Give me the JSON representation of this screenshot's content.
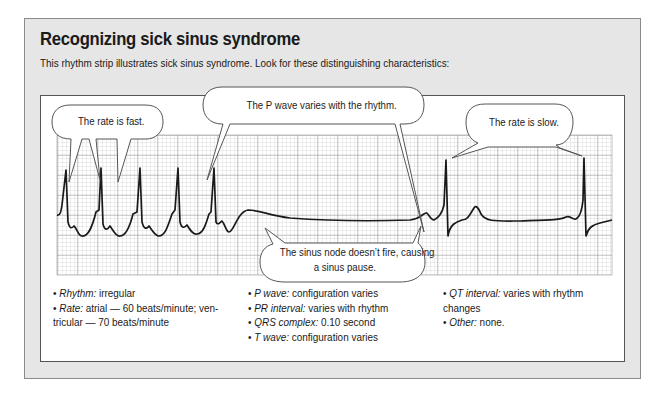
{
  "figure": {
    "title": "Recognizing sick sinus syndrome",
    "subtitle": "This rhythm strip illustrates sick sinus syndrome. Look for these distinguishing characteristics:"
  },
  "callouts": {
    "fast": "The rate is fast.",
    "p_wave": "The P wave varies with the rhythm.",
    "slow": "The rate is slow.",
    "pause_line1": "The sinus node doesn’t fire, causing",
    "pause_line2": "a sinus pause."
  },
  "characteristics": {
    "col1": [
      {
        "label": "Rhythm:",
        "value": " irregular"
      },
      {
        "label": "Rate:",
        "value": " atrial — 60 beats/minute; ven-"
      },
      {
        "label": "",
        "value": "tricular — 70 beats/minute",
        "continuation": true
      }
    ],
    "col2": [
      {
        "label": "P wave:",
        "value": " configuration varies"
      },
      {
        "label": "PR interval:",
        "value": " varies with rhythm"
      },
      {
        "label": "QRS complex:",
        "value": " 0.10 second"
      },
      {
        "label": "T wave:",
        "value": " configuration varies"
      }
    ],
    "col3": [
      {
        "label": "QT interval:",
        "value": " varies with rhythm"
      },
      {
        "label": "",
        "value": "changes",
        "continuation": true
      },
      {
        "label": "Other:",
        "value": " none."
      }
    ]
  },
  "bullet": "•",
  "colors": {
    "panel_bg": "#e6e6e6",
    "grid_minor": "#bdbdbd",
    "grid_major": "#8c8c8c",
    "trace": "#1a1a1a"
  }
}
